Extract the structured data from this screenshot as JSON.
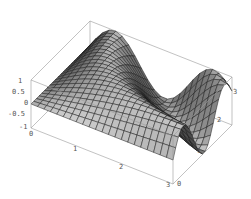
{
  "chart_data": {
    "type": "surface3d",
    "title": "",
    "xlabel": "",
    "ylabel": "",
    "zlabel": "",
    "x_ticks": [
      "0",
      "1",
      "2",
      "3"
    ],
    "y_ticks": [
      "0",
      "1",
      "2",
      "3"
    ],
    "z_ticks": [
      "1",
      "0.5",
      "0",
      "-0.5",
      "-1"
    ],
    "xlim": [
      0,
      3
    ],
    "ylim": [
      0,
      3
    ],
    "zlim": [
      -1,
      1
    ],
    "box": true,
    "mesh": true,
    "surface_color": "#8a8a8a"
  },
  "axes": {
    "z": [
      {
        "label": "1",
        "x": 18,
        "y": 78
      },
      {
        "label": "0.5",
        "x": 12,
        "y": 89
      },
      {
        "label": "0",
        "x": 24,
        "y": 100
      },
      {
        "label": "-0.5",
        "x": 8,
        "y": 111
      },
      {
        "label": "-1",
        "x": 19,
        "y": 124
      }
    ],
    "x": [
      {
        "label": "0",
        "x": 29,
        "y": 131
      },
      {
        "label": "1",
        "x": 73,
        "y": 146
      },
      {
        "label": "2",
        "x": 119,
        "y": 164
      },
      {
        "label": "3",
        "x": 166,
        "y": 182
      }
    ],
    "y": [
      {
        "label": "0",
        "x": 177,
        "y": 181
      },
      {
        "label": "1",
        "x": 197,
        "y": 148
      },
      {
        "label": "2",
        "x": 217,
        "y": 117
      },
      {
        "label": "3",
        "x": 233,
        "y": 89
      }
    ]
  }
}
